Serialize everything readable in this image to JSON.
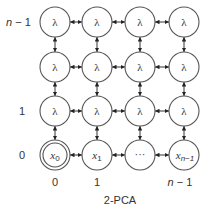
{
  "diagram": {
    "caption": "2-PCA",
    "grid": {
      "columns": 4,
      "rows": 4,
      "column_x": [
        55,
        97,
        140,
        184
      ],
      "row_y": [
        22,
        67,
        111,
        155
      ],
      "node_radius": 15
    },
    "row_labels": [
      {
        "text": "n − 1",
        "italic_part": "n",
        "rest": " − 1",
        "row": 0
      },
      {
        "text": "1",
        "row": 2
      },
      {
        "text": "0",
        "row": 3
      }
    ],
    "column_labels": [
      {
        "text": "0",
        "col": 0
      },
      {
        "text": "1",
        "col": 1
      },
      {
        "text": "n − 1",
        "italic_part": "n",
        "rest": " − 1",
        "col": 3
      }
    ],
    "nodes": [
      [
        {
          "label": "λ"
        },
        {
          "label": "λ"
        },
        {
          "label": "λ"
        },
        {
          "label": "λ"
        }
      ],
      [
        {
          "label": "λ"
        },
        {
          "label": "λ"
        },
        {
          "label": "λ"
        },
        {
          "label": "λ"
        }
      ],
      [
        {
          "label": "λ"
        },
        {
          "label": "λ"
        },
        {
          "label": "λ"
        },
        {
          "label": "λ"
        }
      ],
      [
        {
          "label": "x",
          "sub": "0",
          "double": true
        },
        {
          "label": "x",
          "sub": "1"
        },
        {
          "label": "···"
        },
        {
          "label": "x",
          "sub": "n−1"
        }
      ]
    ],
    "edges": "bidirectional arrows between horizontally and vertically adjacent nodes",
    "colors": {
      "stroke": "#555555",
      "text": "#333333",
      "background": "#ffffff"
    }
  }
}
